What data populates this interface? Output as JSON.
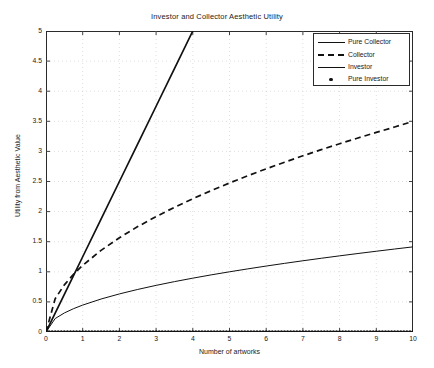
{
  "chart_data": {
    "type": "line",
    "title": "Investor and Collector Aesthetic Utility",
    "xlabel": "Number of artworks",
    "ylabel": "Utility from Aesthetic Value",
    "xlim": [
      0,
      10
    ],
    "ylim": [
      0,
      5
    ],
    "grid": true,
    "grid_style": "dotted",
    "legend_position": "top-right",
    "xticks": [
      0,
      1,
      2,
      3,
      4,
      5,
      6,
      7,
      8,
      9,
      10
    ],
    "xticklabels": [
      "0",
      "1",
      "2",
      "3",
      "4",
      "5",
      "6",
      "7",
      "8",
      "9",
      "10"
    ],
    "yticks": [
      0,
      0.5,
      1,
      1.5,
      2,
      2.5,
      3,
      3.5,
      4,
      4.5,
      5
    ],
    "yticklabels": [
      "0",
      "0.5",
      "1",
      "1.5",
      "2",
      "2.5",
      "3",
      "3.5",
      "4",
      "4.5",
      "5"
    ],
    "x": [
      0,
      0.25,
      0.5,
      0.75,
      1,
      1.5,
      2,
      2.5,
      3,
      3.5,
      4,
      4.5,
      5,
      5.5,
      6,
      6.5,
      7,
      7.5,
      8,
      8.5,
      9,
      9.5,
      10
    ],
    "series": [
      {
        "name": "Pure Collector",
        "style": "solid-thick",
        "color": "#111111",
        "clipped_at_top": true,
        "values": [
          0,
          0.3125,
          0.625,
          0.9375,
          1.25,
          1.875,
          2.5,
          3.125,
          3.75,
          4.375,
          5,
          5.625,
          6.25,
          6.875,
          7.5,
          8.125,
          8.75,
          9.375,
          10,
          10.625,
          11.25,
          11.875,
          12.5
        ]
      },
      {
        "name": "Collector",
        "style": "dashed",
        "color": "#111111",
        "clipped_at_top": false,
        "values": [
          0,
          0.5538,
          0.7829,
          0.9589,
          1.1069,
          1.3559,
          1.5657,
          1.7508,
          1.9172,
          2.0719,
          2.2138,
          2.3483,
          2.475,
          2.5956,
          2.7106,
          2.8209,
          2.9268,
          3.0288,
          3.1274,
          3.2228,
          3.3153,
          3.4052,
          3.5
        ]
      },
      {
        "name": "Investor",
        "style": "solid-thin",
        "color": "#111111",
        "clipped_at_top": false,
        "values": [
          0,
          0.2236,
          0.3162,
          0.3873,
          0.4472,
          0.5477,
          0.6325,
          0.7071,
          0.7746,
          0.8367,
          0.8944,
          0.9487,
          1.0,
          1.0488,
          1.0954,
          1.1402,
          1.1832,
          1.2247,
          1.2649,
          1.3038,
          1.3416,
          1.3784,
          1.4142
        ]
      },
      {
        "name": "Pure Investor",
        "style": "dot-marker",
        "color": "#111111",
        "clipped_at_top": false,
        "constant": 0,
        "values": [
          0,
          0,
          0,
          0,
          0,
          0,
          0,
          0,
          0,
          0,
          0,
          0,
          0,
          0,
          0,
          0,
          0,
          0,
          0,
          0,
          0,
          0,
          0
        ]
      }
    ]
  },
  "legend": {
    "entries": [
      {
        "label": "Pure Collector",
        "style": "solid-thick"
      },
      {
        "label": "Collector",
        "style": "dashed"
      },
      {
        "label": "Investor",
        "style": "solid-thin"
      },
      {
        "label": "Pure Investor",
        "style": "dot-marker"
      }
    ]
  }
}
